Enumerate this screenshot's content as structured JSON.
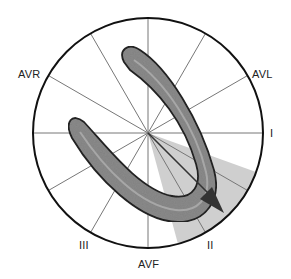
{
  "diagram": {
    "center": [
      148,
      133
    ],
    "radius": 115,
    "colors": {
      "circle": "#111111",
      "spokes": "#777777",
      "sector": "#cfcfcf",
      "loop_fill": "#8a8a8a",
      "loop_stroke": "#222222",
      "arrow": "#333333"
    },
    "leads": [
      {
        "name": "I",
        "angle": 0
      },
      {
        "name": "II",
        "angle": 60
      },
      {
        "name": "III",
        "angle": 120
      },
      {
        "name": "AVR",
        "angle": -150
      },
      {
        "name": "AVL",
        "angle": -30
      },
      {
        "name": "AVF",
        "angle": 90
      }
    ],
    "labels": {
      "avr": "AVR",
      "avl": "AVL",
      "i": "I",
      "ii": "II",
      "iii": "III",
      "avf": "AVF"
    },
    "mean_axis_degrees": 45,
    "sector_range_degrees": [
      20,
      75
    ]
  }
}
